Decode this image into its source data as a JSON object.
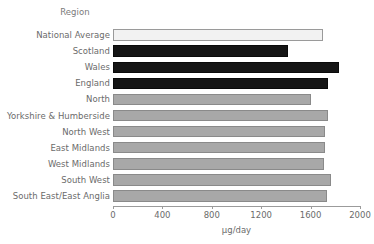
{
  "chart_data": {
    "type": "bar",
    "orientation": "horizontal",
    "title": "",
    "group_title": "Region",
    "xlabel": "µg/day",
    "ylabel": "",
    "xlim": [
      0,
      2000
    ],
    "xticks": [
      0,
      400,
      800,
      1200,
      1600,
      2000
    ],
    "xtick_labels": [
      "0",
      "400",
      "800",
      "1200",
      "1600",
      "2000"
    ],
    "grid": false,
    "legend": false,
    "categories": [
      "National Average",
      "Scotland",
      "Wales",
      "England",
      "North",
      "Yorkshire & Humberside",
      "North West",
      "East Midlands",
      "West Midlands",
      "South West",
      "South East/East Anglia"
    ],
    "values": [
      1700,
      1420,
      1830,
      1740,
      1600,
      1740,
      1715,
      1715,
      1705,
      1765,
      1730
    ],
    "bar_styles": [
      "fill-light",
      "fill-dark",
      "fill-dark",
      "fill-dark",
      "fill-gray",
      "fill-gray",
      "fill-gray",
      "fill-gray",
      "fill-gray",
      "fill-gray",
      "fill-gray"
    ],
    "colors": {
      "light": "#f2f2f2",
      "dark": "#151515",
      "gray": "#a8a8a8",
      "outline": "#8d8d8d",
      "text": "#6b6b6b",
      "axis": "#9b9b9b",
      "background": "#ffffff"
    }
  }
}
